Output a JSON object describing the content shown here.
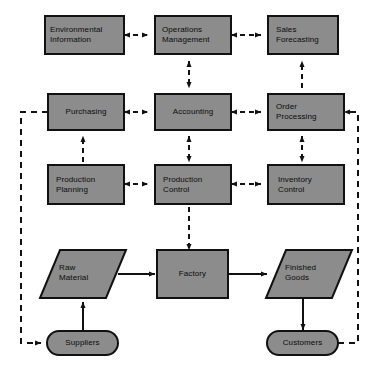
{
  "diagram": {
    "colors": {
      "node_fill": "#8c8c8c",
      "node_stroke": "#111111",
      "background": "#ffffff",
      "line": "#111111",
      "text": "#0b0b0b"
    },
    "nodes": [
      {
        "id": "environmental-information",
        "shape": "rectangle",
        "line1": "Environmental",
        "line2": "Information"
      },
      {
        "id": "operations-management",
        "shape": "rectangle",
        "line1": "Operations",
        "line2": "Management"
      },
      {
        "id": "sales-forecasting",
        "shape": "rectangle",
        "line1": "Sales",
        "line2": "Forecasting"
      },
      {
        "id": "purchasing",
        "shape": "rectangle",
        "line1": "Purchasing",
        "line2": ""
      },
      {
        "id": "accounting",
        "shape": "rectangle",
        "line1": "Accounting",
        "line2": ""
      },
      {
        "id": "order-processing",
        "shape": "rectangle",
        "line1": "Order",
        "line2": "Processing"
      },
      {
        "id": "production-planning",
        "shape": "rectangle",
        "line1": "Production",
        "line2": "Planning"
      },
      {
        "id": "production-control",
        "shape": "rectangle",
        "line1": "Production",
        "line2": "Control"
      },
      {
        "id": "inventory-control",
        "shape": "rectangle",
        "line1": "Inventory",
        "line2": "Control"
      },
      {
        "id": "raw-material",
        "shape": "parallelogram",
        "line1": "Raw",
        "line2": "Material"
      },
      {
        "id": "factory",
        "shape": "rectangle",
        "line1": "Factory",
        "line2": ""
      },
      {
        "id": "finished-goods",
        "shape": "parallelogram",
        "line1": "Finished",
        "line2": "Goods"
      },
      {
        "id": "suppliers",
        "shape": "stadium",
        "line1": "Suppliers",
        "line2": ""
      },
      {
        "id": "customers",
        "shape": "stadium",
        "line1": "Customers",
        "line2": ""
      }
    ],
    "edges": [
      {
        "from": "environmental-information",
        "to": "operations-management",
        "style": "dashed",
        "arrows": "both"
      },
      {
        "from": "operations-management",
        "to": "sales-forecasting",
        "style": "dashed",
        "arrows": "both"
      },
      {
        "from": "operations-management",
        "to": "accounting",
        "style": "dashed",
        "arrows": "both"
      },
      {
        "from": "sales-forecasting",
        "to": "order-processing",
        "style": "dashed",
        "arrows": "both"
      },
      {
        "from": "purchasing",
        "to": "accounting",
        "style": "dashed",
        "arrows": "both"
      },
      {
        "from": "accounting",
        "to": "order-processing",
        "style": "dashed",
        "arrows": "both"
      },
      {
        "from": "production-planning",
        "to": "purchasing",
        "style": "dashed",
        "arrows": "both"
      },
      {
        "from": "accounting",
        "to": "production-control",
        "style": "dashed",
        "arrows": "both"
      },
      {
        "from": "order-processing",
        "to": "inventory-control",
        "style": "dashed",
        "arrows": "both"
      },
      {
        "from": "production-planning",
        "to": "production-control",
        "style": "dashed",
        "arrows": "both"
      },
      {
        "from": "production-control",
        "to": "inventory-control",
        "style": "dashed",
        "arrows": "both"
      },
      {
        "from": "production-control",
        "to": "factory",
        "style": "dashed",
        "arrows": "both"
      },
      {
        "from": "suppliers",
        "to": "raw-material",
        "style": "solid",
        "arrows": "forward"
      },
      {
        "from": "raw-material",
        "to": "factory",
        "style": "solid",
        "arrows": "forward"
      },
      {
        "from": "factory",
        "to": "finished-goods",
        "style": "solid",
        "arrows": "forward"
      },
      {
        "from": "finished-goods",
        "to": "customers",
        "style": "solid",
        "arrows": "forward"
      },
      {
        "from": "purchasing",
        "to": "suppliers",
        "style": "dashed",
        "arrows": "forward",
        "route": "left-perimeter"
      },
      {
        "from": "customers",
        "to": "order-processing",
        "style": "dashed",
        "arrows": "forward",
        "route": "right-perimeter"
      }
    ]
  }
}
